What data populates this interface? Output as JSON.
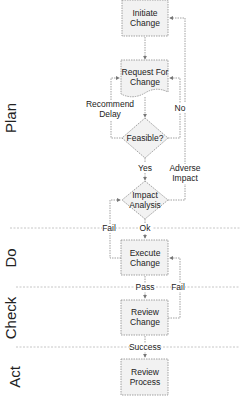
{
  "diagram": {
    "phases": [
      {
        "label": "Plan"
      },
      {
        "label": "Do"
      },
      {
        "label": "Check"
      },
      {
        "label": "Act"
      }
    ],
    "nodes": {
      "initiate_change": {
        "line1": "Initiate",
        "line2": "Change"
      },
      "request_for_change": {
        "line1": "Request For",
        "line2": "Change"
      },
      "feasible": {
        "line1": "Feasible?"
      },
      "impact_analysis": {
        "line1": "Impact",
        "line2": "Analysis"
      },
      "execute_change": {
        "line1": "Execute",
        "line2": "Change"
      },
      "review_change": {
        "line1": "Review",
        "line2": "Change"
      },
      "review_process": {
        "line1": "Review",
        "line2": "Process"
      }
    },
    "edges": {
      "recommend_delay": {
        "line1": "Recommend",
        "line2": "Delay"
      },
      "no": "No",
      "yes": "Yes",
      "adverse_impact": {
        "line1": "Adverse",
        "line2": "Impact"
      },
      "fail_impact": "Fail",
      "ok": "Ok",
      "pass": "Pass",
      "fail_review": "Fail",
      "success": "Success"
    },
    "colors": {
      "box_fill": "#f2f2f2",
      "box_stroke": "#8a8a8a",
      "line": "#8a8a8a",
      "divider": "#b8b8b8"
    }
  }
}
